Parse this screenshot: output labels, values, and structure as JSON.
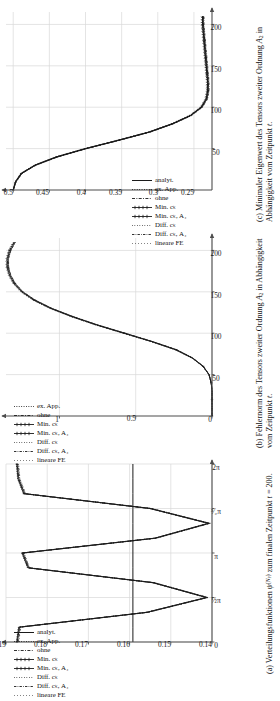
{
  "figure": {
    "orientation": "rotated-90",
    "panels": [
      {
        "tag": "(a)",
        "caption": "Verteilungsfunktionen ψ^(Nₚ) zum finalen Zeitpunkt t = 200.",
        "caption_line1": "Verteilungsfunktionen ψ",
        "caption_line2": "finalen Zeitpunkt t = 200.",
        "chart_data": {
          "type": "line",
          "title": "Verteilungsfunktionen",
          "xlabel": "",
          "ylabel": "",
          "xlim": [
            0,
            6.283185
          ],
          "ylim": [
            0.14,
            0.19
          ],
          "xticks": [
            0,
            1.5707963,
            3.1415927,
            4.712389,
            6.283185
          ],
          "xticklabels": [
            "0",
            "½π",
            "π",
            "³⁄₂π",
            "2π"
          ],
          "yticks": [
            0.14,
            0.15,
            0.16,
            0.17,
            0.18,
            0.19
          ],
          "yticklabels": [
            "0.14",
            "0.15",
            "0.16",
            "0.17",
            "0.18",
            "0.19"
          ],
          "grid": true,
          "legend_position": "upper-left",
          "series": [
            {
              "name": "analyt.",
              "style": "solid",
              "values": [
                0.1592,
                0.1592,
                0.1592,
                0.1592,
                0.1592,
                0.1592,
                0.1592,
                0.1592,
                0.1592,
                0.1592,
                0.1592,
                0.1592,
                0.1592
              ]
            },
            {
              "name": "ex. App.",
              "style": "dotted",
              "values": [
                0.1875,
                0.187,
                0.156,
                0.1415,
                0.1545,
                0.1848,
                0.1862,
                0.154,
                0.141,
                0.1552,
                0.1858,
                0.1872,
                0.1875
              ]
            },
            {
              "name": "ohne",
              "style": "dashdot",
              "values": [
                0.1872,
                0.1868,
                0.1558,
                0.1413,
                0.1543,
                0.1846,
                0.186,
                0.1538,
                0.1408,
                0.155,
                0.1856,
                0.187,
                0.1872
              ]
            },
            {
              "name": "Min. cₖ",
              "style": "solid-marker",
              "values": [
                0.1874,
                0.1869,
                0.1559,
                0.1414,
                0.1544,
                0.1847,
                0.1861,
                0.1539,
                0.1409,
                0.1551,
                0.1857,
                0.1871,
                0.1874
              ]
            },
            {
              "name": "Min. cₖ, A₄",
              "style": "solid-marker2",
              "values": [
                0.1873,
                0.1867,
                0.1557,
                0.1412,
                0.1542,
                0.1845,
                0.1859,
                0.1537,
                0.1407,
                0.1549,
                0.1855,
                0.1869,
                0.1873
              ]
            },
            {
              "name": "Diff. cₖ",
              "style": "fine-dotted",
              "values": [
                0.1871,
                0.1866,
                0.1556,
                0.1411,
                0.1541,
                0.1844,
                0.1858,
                0.1536,
                0.1406,
                0.1548,
                0.1854,
                0.1868,
                0.1871
              ]
            },
            {
              "name": "Diff. cₖ, A₄",
              "style": "fine-dashdot",
              "values": [
                0.187,
                0.1865,
                0.1555,
                0.141,
                0.154,
                0.1843,
                0.1857,
                0.1535,
                0.1405,
                0.1547,
                0.1853,
                0.1867,
                0.187
              ]
            },
            {
              "name": "lineare FE",
              "style": "loose-dotted",
              "values": [
                0.1869,
                0.1864,
                0.1554,
                0.1409,
                0.1539,
                0.1842,
                0.1856,
                0.1534,
                0.1404,
                0.1546,
                0.1852,
                0.1866,
                0.1869
              ]
            }
          ]
        }
      },
      {
        "tag": "(b)",
        "caption": "Fehlernorm des Tensors zweiter Ordnung A₂ in Abhängigkeit vom Zeitpunkt t.",
        "caption_line1": "Fehlernorm des Tensors zweiter Ord-",
        "caption_line2": "nung A₂ in Abhängigkeit vom Zeit-",
        "caption_line3": "punkt t.",
        "axis_multiplier": "·10⁻²",
        "chart_data": {
          "type": "line",
          "title": "Fehlernorm des Tensors zweiter Ordnung",
          "xlabel": "t",
          "ylabel": "",
          "xlim": [
            0,
            215
          ],
          "ylim": [
            0,
            1.35
          ],
          "xticks": [
            50,
            100,
            150,
            200
          ],
          "xticklabels": [
            "50",
            "100",
            "150",
            "200"
          ],
          "yticks": [
            0,
            0.5,
            1.0
          ],
          "yticklabels": [
            "0",
            "0.5",
            "1"
          ],
          "grid": true,
          "legend_position": "upper-left",
          "x": [
            0,
            10,
            20,
            30,
            40,
            50,
            60,
            70,
            80,
            90,
            100,
            110,
            120,
            130,
            140,
            150,
            160,
            170,
            180,
            190,
            200,
            210
          ],
          "series": [
            {
              "name": "ex. App.",
              "style": "dotted",
              "values": [
                0,
                0,
                0,
                0,
                0.005,
                0.02,
                0.06,
                0.13,
                0.24,
                0.4,
                0.58,
                0.76,
                0.92,
                1.06,
                1.17,
                1.25,
                1.3,
                1.33,
                1.345,
                1.345,
                1.33,
                1.3
              ]
            },
            {
              "name": "ohne",
              "style": "dashdot",
              "values": [
                0,
                0,
                0,
                0,
                0.005,
                0.02,
                0.058,
                0.128,
                0.235,
                0.395,
                0.575,
                0.755,
                0.915,
                1.055,
                1.165,
                1.245,
                1.295,
                1.325,
                1.34,
                1.34,
                1.325,
                1.295
              ]
            },
            {
              "name": "Min. cₖ",
              "style": "solid-marker",
              "values": [
                0,
                0,
                0,
                0,
                0.005,
                0.02,
                0.059,
                0.129,
                0.237,
                0.397,
                0.577,
                0.757,
                0.917,
                1.057,
                1.167,
                1.247,
                1.297,
                1.327,
                1.342,
                1.342,
                1.327,
                1.297
              ]
            },
            {
              "name": "Min. cₖ, A₄",
              "style": "solid-marker2",
              "values": [
                0,
                0,
                0,
                0,
                0.005,
                0.019,
                0.057,
                0.126,
                0.232,
                0.392,
                0.57,
                0.75,
                0.91,
                1.05,
                1.16,
                1.24,
                1.29,
                1.32,
                1.335,
                1.335,
                1.32,
                1.29
              ]
            },
            {
              "name": "Diff. cₖ",
              "style": "fine-dotted",
              "values": [
                0,
                0,
                0,
                0,
                0.005,
                0.02,
                0.06,
                0.131,
                0.24,
                0.4,
                0.582,
                0.762,
                0.922,
                1.062,
                1.172,
                1.252,
                1.302,
                1.332,
                1.347,
                1.347,
                1.332,
                1.302
              ]
            },
            {
              "name": "Diff. cₖ, A₄",
              "style": "fine-dashdot",
              "values": [
                0,
                0,
                0,
                0,
                0.005,
                0.019,
                0.056,
                0.125,
                0.23,
                0.39,
                0.568,
                0.748,
                0.908,
                1.048,
                1.158,
                1.238,
                1.288,
                1.318,
                1.333,
                1.333,
                1.318,
                1.288
              ]
            },
            {
              "name": "lineare FE",
              "style": "loose-dotted",
              "values": [
                0,
                0,
                0,
                0,
                0.005,
                0.021,
                0.061,
                0.133,
                0.243,
                0.404,
                0.586,
                0.766,
                0.926,
                1.066,
                1.176,
                1.256,
                1.306,
                1.336,
                1.351,
                1.351,
                1.336,
                1.306
              ]
            }
          ]
        }
      },
      {
        "tag": "(c)",
        "caption": "Minimaler Eigenwert des Tensors zweiter Ordnung A₂ in Abhängigkeit vom Zeitpunkt t.",
        "caption_line1": "Minimaler Eigenwert des Tensors",
        "caption_line2": "zweiter Ordnung A₂ in Abhängigkeit",
        "caption_line3": "vom Zeitpunkt t.",
        "chart_data": {
          "type": "line",
          "title": "Minimaler Eigenwert des Tensors zweiter Ordnung",
          "xlabel": "t",
          "ylabel": "",
          "xlim": [
            0,
            215
          ],
          "ylim": [
            0.225,
            0.51
          ],
          "xticks": [
            50,
            100,
            150,
            200
          ],
          "xticklabels": [
            "50",
            "100",
            "150",
            "200"
          ],
          "yticks": [
            0.25,
            0.3,
            0.35,
            0.4,
            0.45,
            0.5
          ],
          "yticklabels": [
            "0.25",
            "0.3",
            "0.35",
            "0.4",
            "0.45",
            "0.5"
          ],
          "grid": true,
          "legend_position": "lower-left",
          "x": [
            0,
            10,
            20,
            30,
            40,
            50,
            60,
            70,
            80,
            90,
            100,
            110,
            120,
            130,
            140,
            150,
            160,
            170,
            180,
            190,
            200,
            210
          ],
          "series": [
            {
              "name": "analyt.",
              "style": "solid",
              "values": [
                0.5,
                0.497,
                0.489,
                0.47,
                0.44,
                0.4,
                0.355,
                0.312,
                0.28,
                0.255,
                0.24,
                0.233,
                0.231,
                0.231,
                0.232,
                0.233,
                0.234,
                0.235,
                0.236,
                0.237,
                0.238,
                0.238
              ]
            },
            {
              "name": "ex. App.",
              "style": "dotted",
              "values": [
                0.5,
                0.497,
                0.489,
                0.47,
                0.44,
                0.4,
                0.355,
                0.312,
                0.28,
                0.255,
                0.24,
                0.234,
                0.232,
                0.232,
                0.233,
                0.234,
                0.235,
                0.236,
                0.237,
                0.238,
                0.239,
                0.239
              ]
            },
            {
              "name": "ohne",
              "style": "dashdot",
              "values": [
                0.5,
                0.496,
                0.488,
                0.469,
                0.439,
                0.399,
                0.354,
                0.311,
                0.279,
                0.254,
                0.239,
                0.232,
                0.23,
                0.23,
                0.231,
                0.232,
                0.233,
                0.234,
                0.235,
                0.236,
                0.237,
                0.237
              ]
            },
            {
              "name": "Min. cₖ",
              "style": "solid-marker",
              "values": [
                0.5,
                0.497,
                0.489,
                0.47,
                0.44,
                0.4,
                0.355,
                0.312,
                0.28,
                0.255,
                0.24,
                0.233,
                0.231,
                0.231,
                0.232,
                0.233,
                0.234,
                0.235,
                0.236,
                0.237,
                0.238,
                0.238
              ]
            },
            {
              "name": "Min. cₖ, A₄",
              "style": "solid-marker2",
              "values": [
                0.5,
                0.496,
                0.488,
                0.469,
                0.439,
                0.399,
                0.354,
                0.311,
                0.279,
                0.254,
                0.239,
                0.232,
                0.23,
                0.23,
                0.231,
                0.232,
                0.233,
                0.234,
                0.235,
                0.236,
                0.237,
                0.237
              ]
            },
            {
              "name": "Diff. cₖ",
              "style": "fine-dotted",
              "values": [
                0.5,
                0.497,
                0.49,
                0.471,
                0.441,
                0.401,
                0.356,
                0.313,
                0.281,
                0.256,
                0.241,
                0.234,
                0.232,
                0.232,
                0.233,
                0.234,
                0.235,
                0.236,
                0.237,
                0.238,
                0.239,
                0.239
              ]
            },
            {
              "name": "Diff. cₖ, A₄",
              "style": "fine-dashdot",
              "values": [
                0.5,
                0.496,
                0.488,
                0.468,
                0.438,
                0.398,
                0.353,
                0.31,
                0.278,
                0.253,
                0.238,
                0.231,
                0.229,
                0.229,
                0.23,
                0.231,
                0.232,
                0.233,
                0.234,
                0.235,
                0.236,
                0.236
              ]
            },
            {
              "name": "lineare FE",
              "style": "loose-dotted",
              "values": [
                0.5,
                0.497,
                0.49,
                0.471,
                0.442,
                0.402,
                0.357,
                0.314,
                0.282,
                0.257,
                0.242,
                0.235,
                0.233,
                0.233,
                0.234,
                0.235,
                0.236,
                0.237,
                0.238,
                0.239,
                0.24,
                0.24
              ]
            }
          ]
        }
      }
    ],
    "colors": {
      "axis": "#4d4d4d",
      "grid": "#d9d9d9",
      "curve": "#1a1a1a",
      "background": "#ffffff"
    }
  }
}
